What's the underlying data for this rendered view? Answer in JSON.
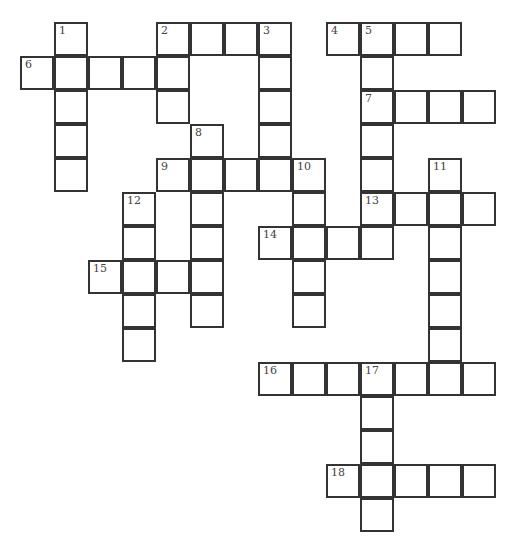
{
  "puzzle": {
    "title_clipped": "",
    "cells": [
      {
        "r": 0,
        "c": 1,
        "n": "1"
      },
      {
        "r": 0,
        "c": 4,
        "n": "2"
      },
      {
        "r": 0,
        "c": 5
      },
      {
        "r": 0,
        "c": 6
      },
      {
        "r": 0,
        "c": 7,
        "n": "3"
      },
      {
        "r": 0,
        "c": 9,
        "n": "4"
      },
      {
        "r": 0,
        "c": 10,
        "n": "5"
      },
      {
        "r": 0,
        "c": 11
      },
      {
        "r": 0,
        "c": 12
      },
      {
        "r": 1,
        "c": 0,
        "n": "6"
      },
      {
        "r": 1,
        "c": 1
      },
      {
        "r": 1,
        "c": 2
      },
      {
        "r": 1,
        "c": 3
      },
      {
        "r": 1,
        "c": 4
      },
      {
        "r": 1,
        "c": 7
      },
      {
        "r": 1,
        "c": 10
      },
      {
        "r": 2,
        "c": 1
      },
      {
        "r": 2,
        "c": 4
      },
      {
        "r": 2,
        "c": 7
      },
      {
        "r": 2,
        "c": 10,
        "n": "7"
      },
      {
        "r": 2,
        "c": 11
      },
      {
        "r": 2,
        "c": 12
      },
      {
        "r": 2,
        "c": 13
      },
      {
        "r": 3,
        "c": 1
      },
      {
        "r": 3,
        "c": 5,
        "n": "8"
      },
      {
        "r": 3,
        "c": 7
      },
      {
        "r": 3,
        "c": 10
      },
      {
        "r": 4,
        "c": 1
      },
      {
        "r": 4,
        "c": 4,
        "n": "9"
      },
      {
        "r": 4,
        "c": 5
      },
      {
        "r": 4,
        "c": 6
      },
      {
        "r": 4,
        "c": 7
      },
      {
        "r": 4,
        "c": 8,
        "n": "10"
      },
      {
        "r": 4,
        "c": 10
      },
      {
        "r": 4,
        "c": 12,
        "n": "11"
      },
      {
        "r": 5,
        "c": 3,
        "n": "12"
      },
      {
        "r": 5,
        "c": 5
      },
      {
        "r": 5,
        "c": 8
      },
      {
        "r": 5,
        "c": 10,
        "n": "13"
      },
      {
        "r": 5,
        "c": 11
      },
      {
        "r": 5,
        "c": 12
      },
      {
        "r": 5,
        "c": 13
      },
      {
        "r": 6,
        "c": 3
      },
      {
        "r": 6,
        "c": 5
      },
      {
        "r": 6,
        "c": 7,
        "n": "14"
      },
      {
        "r": 6,
        "c": 8
      },
      {
        "r": 6,
        "c": 9
      },
      {
        "r": 6,
        "c": 10
      },
      {
        "r": 6,
        "c": 12
      },
      {
        "r": 7,
        "c": 2,
        "n": "15"
      },
      {
        "r": 7,
        "c": 3
      },
      {
        "r": 7,
        "c": 4
      },
      {
        "r": 7,
        "c": 5
      },
      {
        "r": 7,
        "c": 8
      },
      {
        "r": 7,
        "c": 12
      },
      {
        "r": 8,
        "c": 3
      },
      {
        "r": 8,
        "c": 5
      },
      {
        "r": 8,
        "c": 8
      },
      {
        "r": 8,
        "c": 12
      },
      {
        "r": 9,
        "c": 3
      },
      {
        "r": 9,
        "c": 12
      },
      {
        "r": 10,
        "c": 7,
        "n": "16"
      },
      {
        "r": 10,
        "c": 8
      },
      {
        "r": 10,
        "c": 9
      },
      {
        "r": 10,
        "c": 10,
        "n": "17"
      },
      {
        "r": 10,
        "c": 11
      },
      {
        "r": 10,
        "c": 12
      },
      {
        "r": 10,
        "c": 13
      },
      {
        "r": 11,
        "c": 10
      },
      {
        "r": 12,
        "c": 10
      },
      {
        "r": 13,
        "c": 9,
        "n": "18"
      },
      {
        "r": 13,
        "c": 10
      },
      {
        "r": 13,
        "c": 11
      },
      {
        "r": 13,
        "c": 12
      },
      {
        "r": 13,
        "c": 13
      },
      {
        "r": 14,
        "c": 10
      }
    ],
    "clues_across": [
      "2",
      "4",
      "6",
      "7",
      "9",
      "13",
      "14",
      "15",
      "16",
      "18"
    ],
    "clues_down": [
      "1",
      "2",
      "3",
      "5",
      "8",
      "10",
      "11",
      "12",
      "17"
    ]
  }
}
